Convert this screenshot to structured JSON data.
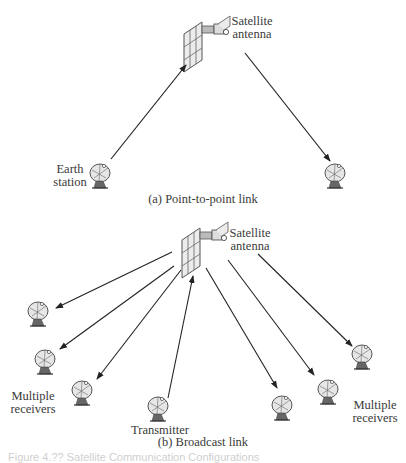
{
  "panel_a": {
    "satellite_label_1": "Satellite",
    "satellite_label_2": "antenna",
    "earth_label_1": "Earth",
    "earth_label_2": "station",
    "caption": "(a) Point-to-point link"
  },
  "panel_b": {
    "satellite_label_1": "Satellite",
    "satellite_label_2": "antenna",
    "left_receivers_1": "Multiple",
    "left_receivers_2": "receivers",
    "right_receivers_1": "Multiple",
    "right_receivers_2": "receivers",
    "transmitter_label": "Transmitter",
    "caption": "(b) Broadcast link"
  },
  "figure_caption": "Figure 4.?? Satellite Communication Configurations",
  "colors": {
    "line": "#222222",
    "text": "#3a3a3a",
    "icon_fill": "#e6e6e6",
    "icon_stroke": "#555555"
  }
}
